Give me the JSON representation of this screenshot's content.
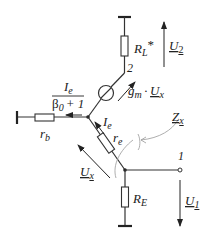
{
  "labels": {
    "rl": "R",
    "rl_sub": "L",
    "rl_star": "*",
    "u2": "U",
    "u2_sub": "2",
    "node2": "2",
    "gm": "g",
    "gm_sub": "m",
    "gm_dot": "·",
    "ux_src": "U",
    "ux_src_sub": "x",
    "ie_frac_num": "I",
    "ie_frac_num_sub": "e",
    "ie_frac_den_beta": "β",
    "ie_frac_den_sub": "0",
    "ie_frac_den_rest": "+ 1",
    "rb": "r",
    "rb_sub": "b",
    "ie": "I",
    "ie_sub": "e",
    "re": "r",
    "re_sub": "e",
    "zx": "Z",
    "zx_sub": "x",
    "ux": "U",
    "ux_sub": "x",
    "node1": "1",
    "re_big": "R",
    "re_big_sub": "E",
    "u1": "U",
    "u1_sub": "1"
  },
  "colors": {
    "wire": "#333333",
    "annotation": "#999999"
  }
}
